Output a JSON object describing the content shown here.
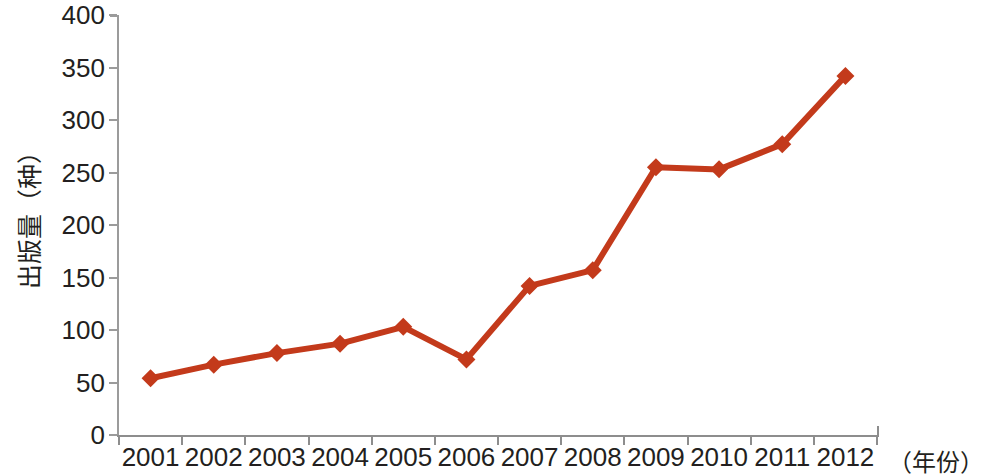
{
  "chart_data": {
    "type": "line",
    "title": "",
    "subtitle": "",
    "xlabel": "（年份）",
    "ylabel": "出版量（种）",
    "categories": [
      "2001",
      "2002",
      "2003",
      "2004",
      "2005",
      "2006",
      "2007",
      "2008",
      "2009",
      "2010",
      "2011",
      "2012"
    ],
    "values": [
      54,
      67,
      78,
      87,
      103,
      72,
      142,
      157,
      255,
      253,
      277,
      342
    ],
    "series": [
      {
        "name": "出版量",
        "values": [
          54,
          67,
          78,
          87,
          103,
          72,
          142,
          157,
          255,
          253,
          277,
          342
        ],
        "color": "#C33A1B",
        "marker": "diamond"
      }
    ],
    "ylim": [
      0,
      400
    ],
    "ytick_labels": [
      "0",
      "50",
      "100",
      "150",
      "200",
      "250",
      "300",
      "350",
      "400"
    ],
    "ytick_values": [
      0,
      50,
      100,
      150,
      200,
      250,
      300,
      350,
      400
    ],
    "grid": false,
    "legend": "none",
    "axis_color": "#9b9b9b",
    "text_color": "#231f20"
  }
}
